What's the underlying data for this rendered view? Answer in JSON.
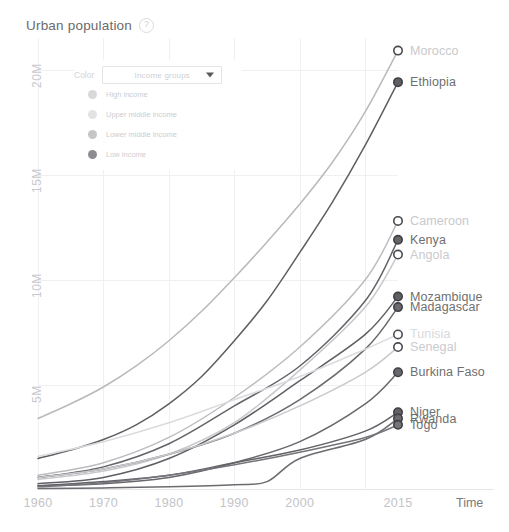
{
  "header": {
    "title": "Urban population",
    "help_icon": "question-mark-icon"
  },
  "legend": {
    "color_label": "Color",
    "dropdown": {
      "value": "Income groups",
      "caret_icon": "chevron-down-icon"
    },
    "items": [
      {
        "label": "High income",
        "color": "#d8d8da"
      },
      {
        "label": "Upper middle income",
        "color": "#e3e3e5"
      },
      {
        "label": "Lower middle income",
        "color": "#c6c6c9"
      },
      {
        "label": "Low income",
        "color": "#8d8d91"
      }
    ]
  },
  "chart_data": {
    "type": "line",
    "title": "Urban population",
    "xlabel": "Time",
    "ylabel": "",
    "xlim": [
      1960,
      2015
    ],
    "ylim": [
      0,
      21500000
    ],
    "grid": true,
    "legend_position": "upper-left-overlay",
    "x_ticks": [
      1960,
      1970,
      1980,
      1990,
      2000,
      2015
    ],
    "y_ticks": [
      5000000,
      10000000,
      15000000,
      20000000
    ],
    "y_tick_labels": [
      "5M",
      "10M",
      "15M",
      "20M"
    ],
    "series": [
      {
        "name": "Morocco",
        "income_group": "Lower middle income",
        "color": "#b9b9bd",
        "marker": "hollow",
        "label_color": "#c9c9cd",
        "end_value": 20900000,
        "x": [
          1960,
          1965,
          1970,
          1975,
          1980,
          1985,
          1990,
          1995,
          2000,
          2005,
          2010,
          2015
        ],
        "values": [
          3400000,
          4100000,
          4900000,
          5900000,
          7100000,
          8500000,
          10100000,
          11800000,
          13600000,
          15600000,
          18000000,
          20900000
        ]
      },
      {
        "name": "Ethiopia",
        "income_group": "Low income",
        "color": "#5e5e63",
        "marker": "filled",
        "label_color": "#6f6f6f",
        "end_value": 19400000,
        "x": [
          1960,
          1965,
          1970,
          1975,
          1980,
          1985,
          1990,
          1995,
          2000,
          2005,
          2010,
          2015
        ],
        "values": [
          1500000,
          1900000,
          2400000,
          3100000,
          4100000,
          5400000,
          7100000,
          9000000,
          11300000,
          13700000,
          16400000,
          19400000
        ]
      },
      {
        "name": "Cameroon",
        "income_group": "Lower middle income",
        "color": "#bcbcc0",
        "marker": "hollow",
        "label_color": "#c9c9cd",
        "end_value": 12800000,
        "x": [
          1960,
          1970,
          1980,
          1990,
          2000,
          2010,
          2015
        ],
        "values": [
          700000,
          1300000,
          2500000,
          4400000,
          6800000,
          10000000,
          12800000
        ]
      },
      {
        "name": "Kenya",
        "income_group": "Low income",
        "color": "#636368",
        "marker": "filled",
        "label_color": "#6f6f6f",
        "end_value": 11900000,
        "x": [
          1960,
          1970,
          1980,
          1990,
          2000,
          2010,
          2015
        ],
        "values": [
          600000,
          1100000,
          2200000,
          4000000,
          5900000,
          9000000,
          11900000
        ]
      },
      {
        "name": "Angola",
        "income_group": "Lower middle income",
        "color": "#c8c8cc",
        "marker": "hollow",
        "label_color": "#cacace",
        "end_value": 11200000,
        "x": [
          1960,
          1970,
          1980,
          1990,
          2000,
          2010,
          2015
        ],
        "values": [
          500000,
          900000,
          1700000,
          3200000,
          5700000,
          8700000,
          11200000
        ]
      },
      {
        "name": "Mozambique",
        "income_group": "Low income",
        "color": "#5f5f64",
        "marker": "filled",
        "label_color": "#6f6f6f",
        "end_value": 9200000,
        "x": [
          1960,
          1970,
          1980,
          1990,
          2000,
          2010,
          2015
        ],
        "values": [
          300000,
          600000,
          1500000,
          3100000,
          5200000,
          7400000,
          9200000
        ]
      },
      {
        "name": "Madagascar",
        "income_group": "Low income",
        "color": "#6a6a6f",
        "marker": "filled",
        "label_color": "#6f6f6f",
        "end_value": 8700000,
        "x": [
          1960,
          1970,
          1980,
          1990,
          2000,
          2010,
          2015
        ],
        "values": [
          600000,
          1000000,
          1700000,
          2700000,
          4300000,
          6700000,
          8700000
        ]
      },
      {
        "name": "Tunisia",
        "income_group": "Upper middle income",
        "color": "#dbdbde",
        "marker": "hollow",
        "label_color": "#d9d9dc",
        "end_value": 7400000,
        "x": [
          1960,
          1970,
          1980,
          1990,
          2000,
          2010,
          2015
        ],
        "values": [
          1600000,
          2300000,
          3200000,
          4300000,
          5400000,
          6700000,
          7400000
        ]
      },
      {
        "name": "Senegal",
        "income_group": "Lower middle income",
        "color": "#cacace",
        "marker": "hollow",
        "label_color": "#cacace",
        "end_value": 6800000,
        "x": [
          1960,
          1970,
          1980,
          1990,
          2000,
          2010,
          2015
        ],
        "values": [
          600000,
          1000000,
          1700000,
          2700000,
          4000000,
          5600000,
          6800000
        ]
      },
      {
        "name": "Burkina Faso",
        "income_group": "Low income",
        "color": "#68686d",
        "marker": "filled",
        "label_color": "#6f6f6f",
        "end_value": 5600000,
        "x": [
          1960,
          1970,
          1980,
          1990,
          2000,
          2010,
          2015
        ],
        "values": [
          200000,
          300000,
          600000,
          1300000,
          2300000,
          4100000,
          5600000
        ]
      },
      {
        "name": "Niger",
        "income_group": "Low income",
        "color": "#616166",
        "marker": "filled",
        "label_color": "#6f6f6f",
        "end_value": 3700000,
        "x": [
          1960,
          1970,
          1980,
          1990,
          2000,
          2010,
          2015
        ],
        "values": [
          200000,
          400000,
          700000,
          1300000,
          1900000,
          2800000,
          3700000
        ]
      },
      {
        "name": "Rwanda",
        "income_group": "Low income",
        "color": "#6b6b70",
        "marker": "filled",
        "label_color": "#6f6f6f",
        "end_value": 3400000,
        "x": [
          1960,
          1970,
          1980,
          1990,
          1995,
          2000,
          2010,
          2015
        ],
        "values": [
          70000,
          100000,
          150000,
          250000,
          400000,
          1500000,
          2400000,
          3400000
        ]
      },
      {
        "name": "Togo",
        "income_group": "Low income",
        "color": "#74747a",
        "marker": "filled",
        "label_color": "#6f6f6f",
        "end_value": 3100000,
        "x": [
          1960,
          1970,
          1980,
          1990,
          2000,
          2010,
          2015
        ],
        "values": [
          150000,
          350000,
          700000,
          1200000,
          1800000,
          2500000,
          3100000
        ]
      }
    ]
  }
}
